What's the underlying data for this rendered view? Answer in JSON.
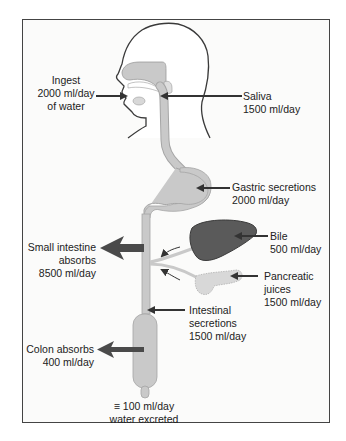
{
  "diagram": {
    "labels": {
      "ingest": {
        "l1": "Ingest",
        "l2": "2000 ml/day",
        "l3": "of water"
      },
      "saliva": {
        "l1": "Saliva",
        "l2": "1500 ml/day"
      },
      "gastric": {
        "l1": "Gastric secretions",
        "l2": "2000 ml/day"
      },
      "bile": {
        "l1": "Bile",
        "l2": "500 ml/day"
      },
      "small_intestine": {
        "l1": "Small intestine",
        "l2": "absorbs",
        "l3": "8500 ml/day"
      },
      "pancreatic": {
        "l1": "Pancreatic",
        "l2": "juices",
        "l3": "1500 ml/day"
      },
      "intestinal": {
        "l1": "Intestinal",
        "l2": "secretions",
        "l3": "1500 ml/day"
      },
      "colon": {
        "l1": "Colon absorbs",
        "l2": "400 ml/day"
      },
      "excreted": {
        "l1": "≡ 100 ml/day",
        "l2": "water excreted"
      }
    },
    "colors": {
      "tract": "#c9c9c9",
      "tract_outline": "#a5a5a5",
      "liver": "#5a5a5a",
      "pancreas": "#d8d8d8",
      "arrow": "#333333",
      "big_arrow": "#4a4a4a",
      "frame": "#444444"
    }
  }
}
